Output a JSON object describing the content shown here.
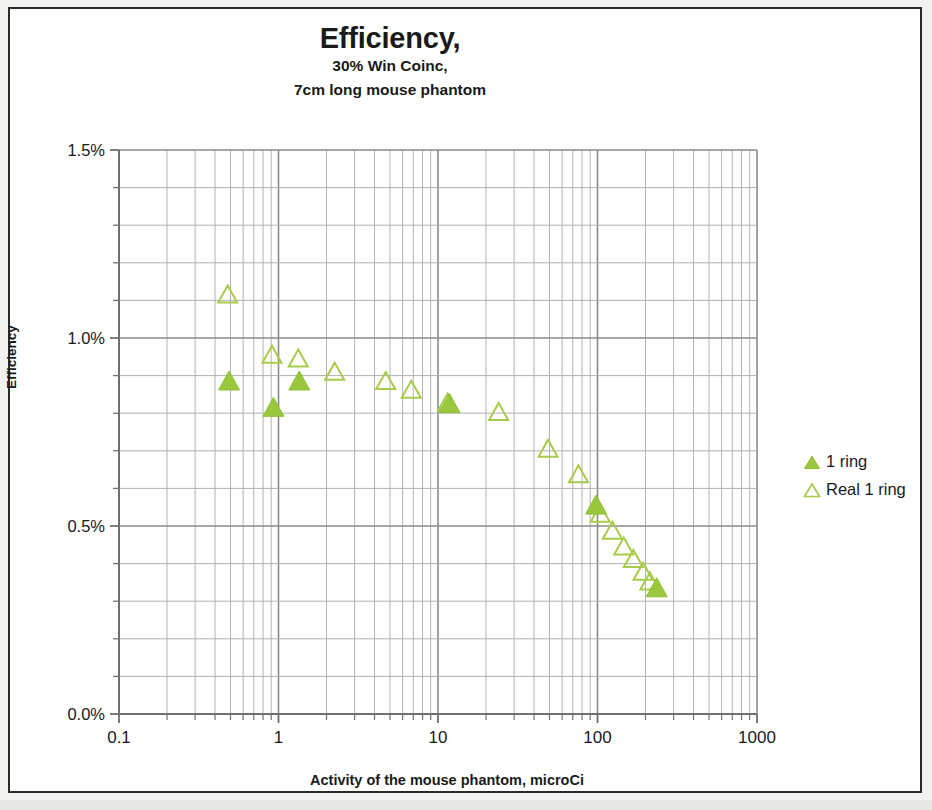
{
  "chart_data": {
    "type": "scatter",
    "title": "Efficiency,",
    "subtitle_1": "30% Win Coinc,",
    "subtitle_2": "7cm long mouse phantom",
    "xlabel": "Activity of the mouse phantom, microCi",
    "ylabel": "Efficiency",
    "xscale": "log",
    "yscale": "linear",
    "xlim": [
      0.1,
      1000
    ],
    "ylim": [
      0.0,
      1.5
    ],
    "x_tick_labels": [
      "0.1",
      "1",
      "10",
      "100",
      "1000"
    ],
    "x_tick_values": [
      0.1,
      1,
      10,
      100,
      1000
    ],
    "y_tick_labels": [
      "0.0%",
      "0.5%",
      "1.0%",
      "1.5%"
    ],
    "y_tick_values": [
      0.0,
      0.5,
      1.0,
      1.5
    ],
    "y_minor_step": 0.1,
    "grid": true,
    "legend_position": "right",
    "marker_color": "#9AC83C",
    "marker_outline_color": "#A8CC4A",
    "grid_color": "#999999",
    "series": [
      {
        "name": "1 ring",
        "marker": "filled-triangle",
        "color": "#9AC83C",
        "points": [
          {
            "x": 0.49,
            "y": 0.885
          },
          {
            "x": 0.93,
            "y": 0.815
          },
          {
            "x": 1.35,
            "y": 0.885
          },
          {
            "x": 11.8,
            "y": 0.825
          },
          {
            "x": 98,
            "y": 0.555
          },
          {
            "x": 235,
            "y": 0.335
          }
        ]
      },
      {
        "name": "Real 1 ring",
        "marker": "open-triangle",
        "color": "#A8CC4A",
        "points": [
          {
            "x": 0.48,
            "y": 1.115
          },
          {
            "x": 0.91,
            "y": 0.955
          },
          {
            "x": 1.33,
            "y": 0.945
          },
          {
            "x": 2.25,
            "y": 0.91
          },
          {
            "x": 4.7,
            "y": 0.885
          },
          {
            "x": 6.8,
            "y": 0.862
          },
          {
            "x": 11.5,
            "y": 0.828
          },
          {
            "x": 24,
            "y": 0.803
          },
          {
            "x": 49,
            "y": 0.705
          },
          {
            "x": 76,
            "y": 0.637
          },
          {
            "x": 104,
            "y": 0.532
          },
          {
            "x": 124,
            "y": 0.487
          },
          {
            "x": 146,
            "y": 0.445
          },
          {
            "x": 168,
            "y": 0.412
          },
          {
            "x": 193,
            "y": 0.378
          },
          {
            "x": 213,
            "y": 0.352
          }
        ]
      }
    ]
  },
  "legend": {
    "items": [
      {
        "label": "1 ring"
      },
      {
        "label": "Real 1 ring"
      }
    ]
  }
}
